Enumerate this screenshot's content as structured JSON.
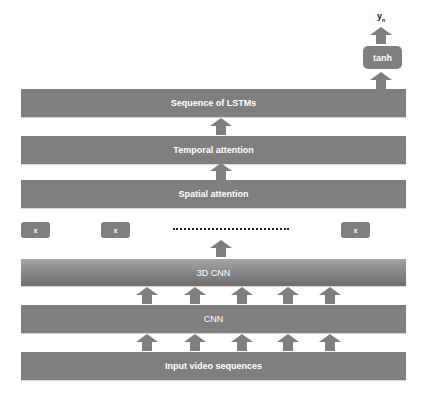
{
  "diagram": {
    "output_label": "y",
    "output_subscript": "n",
    "tanh_label": "tanh",
    "layers": {
      "lstm": "Sequence of LSTMs",
      "temporal": "Temporal attention",
      "spatial": "Spatial attention",
      "cnn3d": "3D CNN",
      "cnn": "CNN",
      "input": "Input video sequences"
    },
    "multiply_nodes": [
      "x",
      "x",
      "x"
    ],
    "ellipsis": "..............................",
    "colors": {
      "bar": "#7f7f7f",
      "arrow": "#7f7f7f",
      "text_on_bar": "#ffffff",
      "background": "#ffffff"
    }
  }
}
